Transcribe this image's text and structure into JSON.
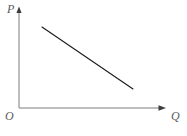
{
  "figure": {
    "background_color": "#ffffff",
    "width": 187,
    "height": 136
  },
  "labels": {
    "y_axis": "P",
    "x_axis": "Q",
    "origin": "O"
  },
  "style": {
    "axis_color": "#7d7d7d",
    "curve_color": "#1a1a1a",
    "label_color": "#5a5a5a",
    "axis_stroke_width": 1,
    "curve_stroke_width": 1.1
  },
  "chart_data": {
    "type": "line",
    "title": "",
    "xlabel": "Q",
    "ylabel": "P",
    "grid": false,
    "legend": null,
    "axis_arrows": {
      "x": true,
      "y": true
    },
    "origin_label": "O",
    "axes_pixel_geometry": {
      "origin": [
        19,
        108
      ],
      "y_axis_top": [
        19,
        8
      ],
      "x_axis_right": [
        166,
        108
      ]
    },
    "series": [
      {
        "name": "Demand",
        "x": [
          42,
          133
        ],
        "y_pixel": [
          27,
          89
        ],
        "points_pixel": [
          [
            42,
            27
          ],
          [
            133,
            89
          ]
        ],
        "slope": "negative",
        "annotation": ""
      }
    ],
    "xlim": [
      0,
      187
    ],
    "ylim": [
      0,
      136
    ]
  }
}
